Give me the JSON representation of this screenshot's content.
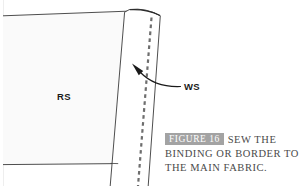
{
  "figure": {
    "labels": {
      "right_side": "RS",
      "wrong_side": "WS"
    },
    "caption": {
      "badge": "FIGURE 16",
      "line1": "SEW THE",
      "line2": "BINDING OR BORDER TO",
      "line3": "THE MAIN FABRIC.",
      "full_text": "FIGURE 16 SEW THE BINDING OR BORDER TO THE MAIN FABRIC."
    },
    "colors": {
      "background": "#ffffff",
      "main_fabric_fill": "#fafafa",
      "binding_fill": "#ffffff",
      "outline": "#3a3a3a",
      "stitch": "#6e6e6e",
      "badge": "#a3a3a3",
      "badge_text": "#ffffff",
      "caption_text": "#4a4a4a",
      "label_text": "#1a1a1a",
      "arrow": "#1a1a1a"
    },
    "elements": {
      "main_fabric": "main-fabric-panel",
      "binding_strip": "binding-strip",
      "stitch_line": "dashed-stitch-line",
      "pointer_arrow": "curved-arrow"
    }
  }
}
